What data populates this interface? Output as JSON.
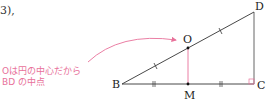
{
  "fragment_text": "3),",
  "annotation": {
    "line1": "Oは円の中心だから",
    "line2": "BD の中点",
    "color": "#e8719a"
  },
  "figure": {
    "points": {
      "B": "B",
      "C": "C",
      "D": "D",
      "O": "O",
      "M": "M"
    },
    "line_color": "#333333",
    "perpendicular_color": "#e8719a"
  }
}
